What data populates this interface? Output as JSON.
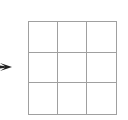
{
  "arrow": {
    "direction": "right",
    "color": "#222222"
  },
  "grid": {
    "rows": 3,
    "cols": 3,
    "line_color": "#a0a0a0"
  }
}
